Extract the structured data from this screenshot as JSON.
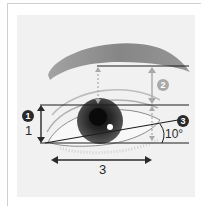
{
  "diagram": {
    "labels": {
      "badge_1": "1",
      "badge_2": "2",
      "badge_3": "3",
      "height_ratio": "1",
      "width_ratio": "3",
      "angle": "10°"
    },
    "colors": {
      "panel": "#f1f1f1",
      "lines": "#1e1e1e",
      "guide_arrows": "#a8a8a8",
      "brow": "#8a8a8a",
      "iris": "#2e2e2e",
      "badge_dark": "#2a2a2a",
      "badge_light": "#a9a9a9"
    }
  }
}
